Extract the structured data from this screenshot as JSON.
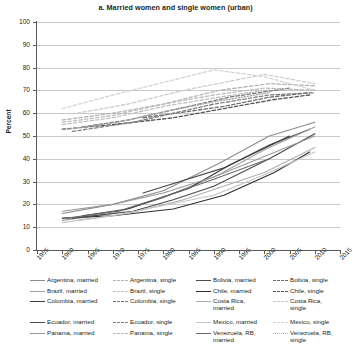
{
  "chart": {
    "title": "a. Married women and single women (urban)",
    "ylabel": "Percent"
  },
  "chart_data": {
    "type": "line",
    "title": "a. Married women and single women (urban)",
    "subtitle": "",
    "xlabel": "",
    "ylabel": "Percent",
    "xlim": [
      1955,
      2015
    ],
    "ylim": [
      0,
      100
    ],
    "xticks": [
      1955,
      1960,
      1965,
      1970,
      1975,
      1980,
      1985,
      1990,
      1995,
      2000,
      2005,
      2010,
      2015
    ],
    "yticks": [
      0,
      10,
      20,
      30,
      40,
      50,
      60,
      70,
      80,
      90,
      100
    ],
    "grid": "horizontal",
    "legend_position": "below",
    "note": "Labor force participation rates. Solid lines = married women, dashed lines = single women.",
    "series": [
      {
        "name": "Argentina, married",
        "style": "solid",
        "color": "#8c8c8c",
        "x": [
          1960,
          1970,
          1980,
          1991,
          2001,
          2010
        ],
        "y": [
          16,
          20,
          26,
          38,
          50,
          56
        ]
      },
      {
        "name": "Argentina, single",
        "style": "dashed",
        "color": "#b5b5b5",
        "x": [
          1960,
          1970,
          1980,
          1991,
          2001,
          2010
        ],
        "y": [
          57,
          60,
          64,
          70,
          73,
          72
        ]
      },
      {
        "name": "Bolivia, married",
        "style": "solid",
        "color": "#4d4d4d",
        "x": [
          1976,
          1992,
          2001,
          2009
        ],
        "y": [
          25,
          36,
          46,
          53
        ]
      },
      {
        "name": "Bolivia, single",
        "style": "dashed",
        "color": "#6e6e6e",
        "x": [
          1976,
          1992,
          2001,
          2009
        ],
        "y": [
          58,
          63,
          67,
          69
        ]
      },
      {
        "name": "Brazil, married",
        "style": "solid",
        "color": "#a0a0a0",
        "x": [
          1960,
          1970,
          1980,
          1991,
          2000,
          2010
        ],
        "y": [
          13,
          16,
          23,
          33,
          44,
          54
        ]
      },
      {
        "name": "Brazil, single",
        "style": "dashed",
        "color": "#c0c0c0",
        "x": [
          1960,
          1970,
          1980,
          1991,
          2000,
          2010
        ],
        "y": [
          55,
          58,
          63,
          67,
          70,
          70
        ]
      },
      {
        "name": "Chile, married",
        "style": "solid",
        "color": "#2f2f2f",
        "x": [
          1960,
          1970,
          1982,
          1992,
          2002,
          2009
        ],
        "y": [
          14,
          15,
          18,
          24,
          34,
          43
        ]
      },
      {
        "name": "Chile, single",
        "style": "dashed",
        "color": "#555555",
        "x": [
          1960,
          1970,
          1982,
          1992,
          2002,
          2009
        ],
        "y": [
          53,
          55,
          58,
          62,
          66,
          68
        ]
      },
      {
        "name": "Colombia, married",
        "style": "solid",
        "color": "#3d3d3d",
        "x": [
          1964,
          1973,
          1985,
          1993,
          2005
        ],
        "y": [
          15,
          18,
          27,
          37,
          50
        ]
      },
      {
        "name": "Colombia, single",
        "style": "dashed",
        "color": "#787878",
        "x": [
          1964,
          1973,
          1985,
          1993,
          2005
        ],
        "y": [
          54,
          57,
          63,
          67,
          71
        ]
      },
      {
        "name": "Costa Rica, married",
        "style": "solid",
        "color": "#b0b0b0",
        "x": [
          1963,
          1973,
          1984,
          2000,
          2010
        ],
        "y": [
          13,
          16,
          22,
          34,
          45
        ]
      },
      {
        "name": "Costa Rica, single",
        "style": "dashed",
        "color": "#cccccc",
        "x": [
          1963,
          1973,
          1984,
          2000,
          2010
        ],
        "y": [
          60,
          64,
          70,
          77,
          73
        ]
      },
      {
        "name": "Ecuador, married",
        "style": "solid",
        "color": "#4a4a4a",
        "x": [
          1962,
          1974,
          1982,
          1990,
          2001,
          2010
        ],
        "y": [
          14,
          17,
          22,
          28,
          40,
          51
        ]
      },
      {
        "name": "Ecuador, single",
        "style": "dashed",
        "color": "#808080",
        "x": [
          1962,
          1974,
          1982,
          1990,
          2001,
          2010
        ],
        "y": [
          52,
          56,
          60,
          64,
          68,
          69
        ]
      },
      {
        "name": "Mexico, married",
        "style": "solid",
        "color": "#c4c4c4",
        "x": [
          1960,
          1970,
          1990,
          2000,
          2010
        ],
        "y": [
          12,
          15,
          24,
          33,
          43
        ]
      },
      {
        "name": "Mexico, single",
        "style": "dashed",
        "color": "#d4d4d4",
        "x": [
          1960,
          1970,
          1990,
          2000,
          2010
        ],
        "y": [
          62,
          68,
          79,
          76,
          70
        ]
      },
      {
        "name": "Panama, married",
        "style": "solid",
        "color": "#9a9a9a",
        "x": [
          1960,
          1970,
          1980,
          1990,
          2000,
          2010
        ],
        "y": [
          17,
          20,
          25,
          32,
          41,
          50
        ]
      },
      {
        "name": "Panama, single",
        "style": "dashed",
        "color": "#bdbdbd",
        "x": [
          1960,
          1970,
          1980,
          1990,
          2000,
          2010
        ],
        "y": [
          56,
          59,
          64,
          68,
          71,
          70
        ]
      },
      {
        "name": "Venezuela, RB, married",
        "style": "solid",
        "color": "#6a6a6a",
        "x": [
          1961,
          1971,
          1981,
          1990,
          2001
        ],
        "y": [
          14,
          17,
          24,
          31,
          40
        ]
      },
      {
        "name": "Venezuela, RB, single",
        "style": "dotted",
        "color": "#a8a8a8",
        "x": [
          1961,
          1971,
          1981,
          1990,
          2001
        ],
        "y": [
          53,
          56,
          61,
          65,
          69
        ]
      }
    ]
  },
  "legend": {
    "entries": [
      {
        "label": "Argentina, married",
        "color": "#8c8c8c",
        "style": "solid",
        "col": 0,
        "row": 0
      },
      {
        "label": "Argentina, single",
        "color": "#b5b5b5",
        "style": "dashed",
        "col": 1,
        "row": 0
      },
      {
        "label": "Bolivia, married",
        "color": "#4d4d4d",
        "style": "solid",
        "col": 2,
        "row": 0
      },
      {
        "label": "Bolivia, single",
        "color": "#6e6e6e",
        "style": "dashed",
        "col": 3,
        "row": 0
      },
      {
        "label": "Brazil, married",
        "color": "#a0a0a0",
        "style": "solid",
        "col": 0,
        "row": 1
      },
      {
        "label": "Brazil, single",
        "color": "#c0c0c0",
        "style": "dashed",
        "col": 1,
        "row": 1
      },
      {
        "label": "Chile, married",
        "color": "#2f2f2f",
        "style": "solid",
        "col": 2,
        "row": 1
      },
      {
        "label": "Chile, single",
        "color": "#555555",
        "style": "dashed",
        "col": 3,
        "row": 1
      },
      {
        "label": "Colombia, married",
        "color": "#3d3d3d",
        "style": "solid",
        "col": 0,
        "row": 2
      },
      {
        "label": "Colombia, single",
        "color": "#787878",
        "style": "dashed",
        "col": 1,
        "row": 2
      },
      {
        "label": "Costa Rica,\nmarried",
        "color": "#b0b0b0",
        "style": "solid",
        "col": 2,
        "row": 2
      },
      {
        "label": "Costa Rica,\nsingle",
        "color": "#cccccc",
        "style": "dashed",
        "col": 3,
        "row": 2
      },
      {
        "label": "Ecuador, married",
        "color": "#4a4a4a",
        "style": "solid",
        "col": 0,
        "row": 3
      },
      {
        "label": "Ecuador, single",
        "color": "#808080",
        "style": "dashed",
        "col": 1,
        "row": 3
      },
      {
        "label": "Mexico, married",
        "color": "#c4c4c4",
        "style": "solid",
        "col": 2,
        "row": 3
      },
      {
        "label": "Mexico, single",
        "color": "#d4d4d4",
        "style": "dashed",
        "col": 3,
        "row": 3
      },
      {
        "label": "Panama, married",
        "color": "#9a9a9a",
        "style": "solid",
        "col": 0,
        "row": 4
      },
      {
        "label": "Panama, single",
        "color": "#bdbdbd",
        "style": "dashed",
        "col": 1,
        "row": 4
      },
      {
        "label": "Venezuela, RB,\nmarried",
        "color": "#6a6a6a",
        "style": "solid",
        "col": 2,
        "row": 4
      },
      {
        "label": "Venezuela, RB,\nsingle",
        "color": "#a8a8a8",
        "style": "dotted",
        "col": 3,
        "row": 4
      }
    ]
  }
}
